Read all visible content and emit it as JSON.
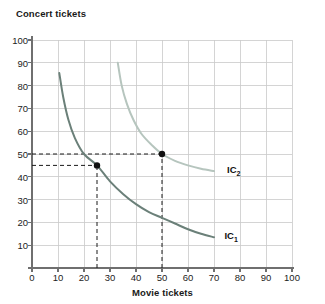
{
  "chart_data": {
    "type": "line",
    "title": "",
    "ylabel": "Concert tickets",
    "xlabel": "Movie tickets",
    "xlim": [
      0,
      100
    ],
    "ylim": [
      0,
      100
    ],
    "xticks": [
      "0",
      "10",
      "20",
      "30",
      "40",
      "50",
      "60",
      "70",
      "80",
      "90",
      "100"
    ],
    "yticks": [
      "10",
      "20",
      "30",
      "40",
      "50",
      "60",
      "70",
      "80",
      "90",
      "100"
    ],
    "grid": true,
    "legend_position": "inline-right-of-curve",
    "series": [
      {
        "name": "IC₁",
        "label": "IC",
        "subscript": "1",
        "color": "#6b8079",
        "points": [
          {
            "x": 10.5,
            "y": 85.5
          },
          {
            "x": 12,
            "y": 75
          },
          {
            "x": 14,
            "y": 65
          },
          {
            "x": 16.5,
            "y": 57
          },
          {
            "x": 20,
            "y": 50
          },
          {
            "x": 25,
            "y": 45
          },
          {
            "x": 30,
            "y": 38
          },
          {
            "x": 35,
            "y": 32.5
          },
          {
            "x": 40,
            "y": 28
          },
          {
            "x": 45,
            "y": 24.5
          },
          {
            "x": 50,
            "y": 22
          },
          {
            "x": 55,
            "y": 19.5
          },
          {
            "x": 60,
            "y": 17
          },
          {
            "x": 65,
            "y": 15
          },
          {
            "x": 70,
            "y": 13.5
          }
        ],
        "label_position": {
          "x": 74,
          "y": 14
        }
      },
      {
        "name": "IC₂",
        "label": "IC",
        "subscript": "2",
        "color": "#b6c5be",
        "points": [
          {
            "x": 33,
            "y": 90
          },
          {
            "x": 34.5,
            "y": 80
          },
          {
            "x": 36.5,
            "y": 72
          },
          {
            "x": 39,
            "y": 65
          },
          {
            "x": 42,
            "y": 59
          },
          {
            "x": 46,
            "y": 54
          },
          {
            "x": 50,
            "y": 50
          },
          {
            "x": 55,
            "y": 47
          },
          {
            "x": 60,
            "y": 45
          },
          {
            "x": 65,
            "y": 43.5
          },
          {
            "x": 70,
            "y": 42.5
          }
        ],
        "label_position": {
          "x": 75,
          "y": 43
        }
      }
    ],
    "markers": [
      {
        "name": "bundle-on-ic1",
        "x": 25,
        "y": 45,
        "color": "#111111"
      },
      {
        "name": "bundle-on-ic2",
        "x": 50,
        "y": 50,
        "color": "#111111"
      }
    ],
    "guides": [
      {
        "name": "horizontal-guide-45",
        "orientation": "horizontal",
        "value": 45,
        "from": 0,
        "to": 25
      },
      {
        "name": "horizontal-guide-50",
        "orientation": "horizontal",
        "value": 50,
        "from": 0,
        "to": 50
      },
      {
        "name": "vertical-guide-25",
        "orientation": "vertical",
        "value": 25,
        "from": 0,
        "to": 45
      },
      {
        "name": "vertical-guide-50",
        "orientation": "vertical",
        "value": 50,
        "from": 0,
        "to": 50
      }
    ],
    "colors": {
      "grid": "#c9c9c9",
      "axis": "#6f6f6f",
      "guide": "#1a1a1a",
      "text": "#1c1c1c"
    }
  }
}
